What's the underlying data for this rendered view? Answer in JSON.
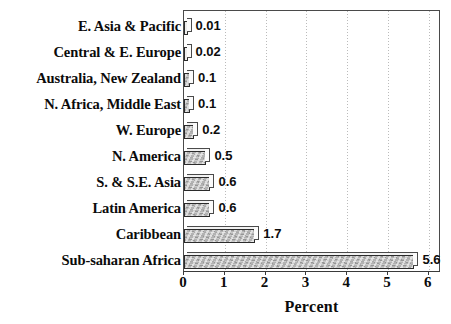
{
  "chart_data": {
    "type": "bar",
    "orientation": "horizontal",
    "title": "",
    "xlabel": "Percent",
    "ylabel": "",
    "xlim": [
      0,
      6
    ],
    "xticks": [
      "0",
      "1",
      "2",
      "3",
      "4",
      "5",
      "6"
    ],
    "grid": "vertical-dotted",
    "legend": "none",
    "categories": [
      "E. Asia & Pacific",
      "Central & E. Europe",
      "Australia, New Zealand",
      "N. Africa, Middle East",
      "W. Europe",
      "N. America",
      "S. & S.E. Asia",
      "Latin America",
      "Caribbean",
      "Sub-saharan Africa"
    ],
    "values": [
      0.01,
      0.02,
      0.1,
      0.1,
      0.2,
      0.5,
      0.6,
      0.6,
      1.7,
      5.6
    ],
    "value_labels": [
      "0.01",
      "0.02",
      "0.1",
      "0.1",
      "0.2",
      "0.5",
      "0.6",
      "0.6",
      "1.7",
      "5.6"
    ]
  },
  "axis": {
    "x_title": "Percent"
  },
  "style": {
    "bar_fill": "#b3b3b3",
    "bar_outline": "#2b2b2b",
    "frame": "#4a4a4a",
    "gridline": "#bbbbbb",
    "text": "#0b0b0b",
    "background": "#ffffff"
  }
}
